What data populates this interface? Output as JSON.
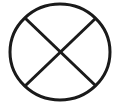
{
  "symbol": {
    "name": "circle-with-cross",
    "icon": "crossed-circle-icon",
    "stroke_color": "#1a1a1a",
    "background_color": "#ffffff",
    "stroke_width": 3
  }
}
